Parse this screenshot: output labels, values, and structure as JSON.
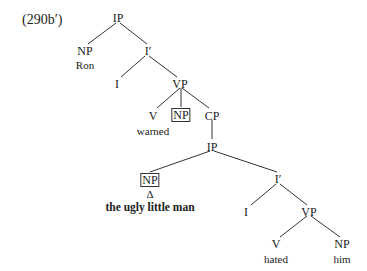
{
  "example_label": "(290b′)",
  "nodes": {
    "ip_root": "IP",
    "np_subj": "NP",
    "ron": "Ron",
    "ibar1": "I′",
    "i1": "I",
    "vp1": "VP",
    "v1": "V",
    "warned": "warned",
    "np_obj": "NP",
    "cp": "CP",
    "ip2": "IP",
    "np2": "NP",
    "delta": "Δ",
    "np2_text": "the ugly little man",
    "ibar2": "I′",
    "i2": "I",
    "vp2": "VP",
    "v2": "V",
    "hated": "hated",
    "np3": "NP",
    "him": "him"
  }
}
